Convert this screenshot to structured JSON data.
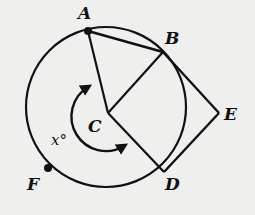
{
  "diagram": {
    "type": "circle-geometry",
    "labels": {
      "A": "A",
      "B": "B",
      "C": "C",
      "D": "D",
      "E": "E",
      "F": "F",
      "angle": "x°"
    },
    "circle": {
      "center": "C"
    },
    "segments": [
      "AB",
      "AC",
      "BC",
      "CD",
      "BE",
      "DE"
    ],
    "marked_points": [
      "A",
      "F"
    ],
    "angle_arc": {
      "from": "A",
      "to": "D",
      "vertex": "C",
      "label": "x°"
    },
    "colors": {
      "background": "#efefed",
      "ink": "#111111"
    }
  }
}
